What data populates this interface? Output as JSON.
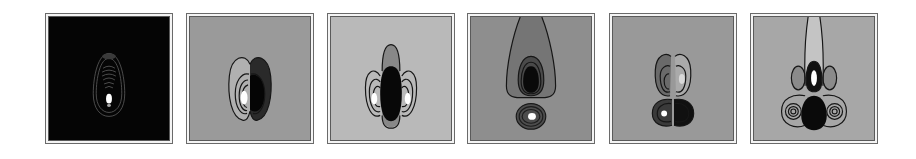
{
  "figure": {
    "panels": [
      {
        "id": "p1",
        "label": "",
        "background": "#050505",
        "line_color": "#5a5a5a",
        "pattern": "single teardrop lobe with concentric contours, bright spot at lower center"
      },
      {
        "id": "p2",
        "label": "",
        "background": "#9a9a9a",
        "line_color": "#1a1a1a",
        "pattern": "two side-by-side lobes; left bright, right dark"
      },
      {
        "id": "p3",
        "label": "",
        "background": "#b9b9b9",
        "line_color": "#1a1a1a",
        "pattern": "three vertical lobes; center dark, sides bright"
      },
      {
        "id": "p4",
        "label": "",
        "background": "#8e8e8e",
        "line_color": "#1a1a1a",
        "pattern": "large upper dark lobe, lower small lobe with bright spot"
      },
      {
        "id": "p5",
        "label": "",
        "background": "#999999",
        "line_color": "#1a1a1a",
        "pattern": "four lobes in 2x2 arrangement; lower-left bright spot"
      },
      {
        "id": "p6",
        "label": "",
        "background": "#a7a7a7",
        "line_color": "#1a1a1a",
        "pattern": "central vertical lobe extending to top, side lobes, lower three-lobe band with concentric rings"
      }
    ]
  }
}
